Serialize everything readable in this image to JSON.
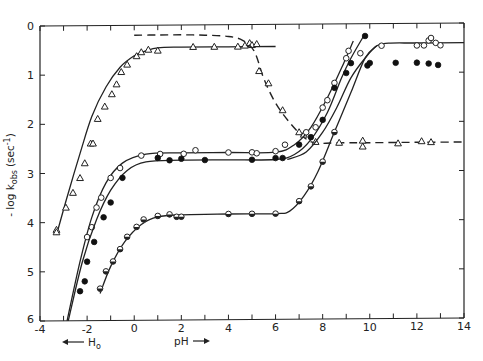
{
  "chart_data": {
    "type": "line",
    "title": "",
    "xlabel": "pH",
    "xlabel_left": "H0",
    "ylabel": "-log k_obs (sec^-1)",
    "xlim": [
      -4,
      14
    ],
    "ylim": [
      6,
      0
    ],
    "y_inverted": true,
    "grid": false,
    "x_ticks": [
      -4,
      -2,
      0,
      2,
      4,
      6,
      8,
      10,
      12,
      14
    ],
    "y_ticks": [
      0,
      1,
      2,
      3,
      4,
      5,
      6
    ],
    "series": [
      {
        "name": "triangles (solid)",
        "marker": "open-triangle",
        "line": "solid",
        "curve": [
          [
            -3.3,
            4.25
          ],
          [
            -2.8,
            3.4
          ],
          [
            -2.3,
            2.6
          ],
          [
            -1.8,
            1.85
          ],
          [
            -1.2,
            1.25
          ],
          [
            -0.6,
            0.85
          ],
          [
            0,
            0.62
          ],
          [
            0.5,
            0.52
          ],
          [
            1,
            0.46
          ],
          [
            2,
            0.45
          ],
          [
            4,
            0.45
          ],
          [
            6,
            0.45
          ]
        ],
        "points": [
          [
            -3.3,
            4.15
          ],
          [
            -3.3,
            4.2
          ],
          [
            -2.9,
            3.7
          ],
          [
            -2.6,
            3.4
          ],
          [
            -2.3,
            3.1
          ],
          [
            -2.1,
            2.8
          ],
          [
            -1.85,
            2.4
          ],
          [
            -1.75,
            2.4
          ],
          [
            -1.55,
            1.9
          ],
          [
            -1.25,
            1.65
          ],
          [
            -0.95,
            1.4
          ],
          [
            -0.75,
            1.2
          ],
          [
            -0.55,
            0.95
          ],
          [
            -0.3,
            0.8
          ],
          [
            0.1,
            0.63
          ],
          [
            0.3,
            0.55
          ],
          [
            0.6,
            0.5
          ],
          [
            1.0,
            0.52
          ],
          [
            2.5,
            0.45
          ],
          [
            3.4,
            0.45
          ],
          [
            4.4,
            0.45
          ],
          [
            4.7,
            0.43
          ],
          [
            4.9,
            0.38
          ],
          [
            5.0,
            0.42
          ],
          [
            5.2,
            0.4
          ]
        ]
      },
      {
        "name": "triangles (dashed)",
        "marker": "open-triangle",
        "line": "dashed",
        "curve": [
          [
            0,
            0.2
          ],
          [
            1,
            0.2
          ],
          [
            2,
            0.2
          ],
          [
            3,
            0.21
          ],
          [
            4,
            0.24
          ],
          [
            4.6,
            0.32
          ],
          [
            5.1,
            0.55
          ],
          [
            5.5,
            1.1
          ],
          [
            6,
            1.6
          ],
          [
            6.6,
            2.0
          ],
          [
            7.2,
            2.3
          ],
          [
            7.7,
            2.42
          ],
          [
            8.5,
            2.42
          ],
          [
            10,
            2.42
          ],
          [
            12,
            2.42
          ],
          [
            14,
            2.42
          ]
        ],
        "points": [
          [
            5.3,
            0.95
          ],
          [
            5.7,
            1.2
          ],
          [
            6.3,
            1.75
          ],
          [
            7.0,
            2.2
          ],
          [
            7.2,
            2.25
          ],
          [
            7.7,
            2.4
          ],
          [
            8.7,
            2.42
          ],
          [
            9.7,
            2.38
          ],
          [
            9.7,
            2.5
          ],
          [
            11.2,
            2.44
          ],
          [
            12.2,
            2.4
          ],
          [
            12.6,
            2.42
          ]
        ]
      },
      {
        "name": "open circles (upper)",
        "marker": "open-circle",
        "line": "solid",
        "curve": [
          [
            -2.85,
            6
          ],
          [
            -2.3,
            4.8
          ],
          [
            -1.8,
            3.9
          ],
          [
            -1.2,
            3.2
          ],
          [
            -0.5,
            2.8
          ],
          [
            0.5,
            2.62
          ],
          [
            2,
            2.6
          ],
          [
            4,
            2.6
          ],
          [
            6,
            2.6
          ],
          [
            6.8,
            2.45
          ],
          [
            7.5,
            2.1
          ],
          [
            8.2,
            1.5
          ],
          [
            8.8,
            0.9
          ],
          [
            9.3,
            0.35
          ]
        ],
        "points": [
          [
            -2.0,
            4.3
          ],
          [
            -1.8,
            4.1
          ],
          [
            -1.6,
            3.7
          ],
          [
            -1.4,
            3.5
          ],
          [
            -1.0,
            3.1
          ],
          [
            -0.6,
            2.9
          ],
          [
            0.3,
            2.65
          ],
          [
            1.1,
            2.62
          ],
          [
            2.1,
            2.62
          ],
          [
            2.6,
            2.55
          ],
          [
            4.0,
            2.6
          ],
          [
            5.0,
            2.6
          ],
          [
            5.2,
            2.62
          ],
          [
            6.0,
            2.58
          ],
          [
            6.4,
            2.45
          ],
          [
            7.3,
            2.2
          ],
          [
            7.7,
            2.1
          ],
          [
            8.0,
            1.7
          ],
          [
            8.2,
            1.55
          ],
          [
            8.5,
            1.2
          ],
          [
            9.0,
            0.7
          ],
          [
            9.1,
            0.55
          ]
        ]
      },
      {
        "name": "filled circles",
        "marker": "filled-circle",
        "line": "solid",
        "curve": [
          [
            -2.8,
            6
          ],
          [
            -2.2,
            4.8
          ],
          [
            -1.6,
            3.95
          ],
          [
            -1.0,
            3.35
          ],
          [
            -0.3,
            2.95
          ],
          [
            0.5,
            2.78
          ],
          [
            2,
            2.75
          ],
          [
            4,
            2.75
          ],
          [
            6,
            2.75
          ],
          [
            6.8,
            2.65
          ],
          [
            7.5,
            2.35
          ],
          [
            8.2,
            1.8
          ],
          [
            8.8,
            1.1
          ],
          [
            9.2,
            0.7
          ],
          [
            9.8,
            0.2
          ]
        ],
        "points": [
          [
            -2.3,
            5.4
          ],
          [
            -2.1,
            5.2
          ],
          [
            -2.0,
            4.8
          ],
          [
            -1.7,
            4.4
          ],
          [
            -1.3,
            3.9
          ],
          [
            -1.0,
            3.6
          ],
          [
            -0.5,
            3.1
          ],
          [
            1.0,
            2.7
          ],
          [
            1.5,
            2.75
          ],
          [
            2.0,
            2.72
          ],
          [
            3.0,
            2.75
          ],
          [
            5.0,
            2.75
          ],
          [
            6.0,
            2.72
          ],
          [
            6.3,
            2.72
          ],
          [
            7.0,
            2.45
          ],
          [
            7.5,
            2.3
          ],
          [
            8.0,
            1.95
          ],
          [
            8.5,
            1.3
          ],
          [
            9.0,
            1.0
          ],
          [
            9.2,
            0.8
          ],
          [
            9.8,
            0.25
          ],
          [
            9.9,
            0.85
          ],
          [
            10.0,
            0.8
          ],
          [
            11.1,
            0.8
          ],
          [
            12.0,
            0.8
          ],
          [
            12.5,
            0.82
          ],
          [
            12.9,
            0.85
          ]
        ]
      },
      {
        "name": "open circles (plateau 0.4)",
        "marker": "open-circle",
        "line": "solid",
        "curve": [
          [
            6.5,
            2.75
          ],
          [
            7.3,
            2.6
          ],
          [
            8.0,
            2.2
          ],
          [
            8.6,
            1.7
          ],
          [
            9.2,
            1.1
          ],
          [
            9.8,
            0.7
          ],
          [
            10.3,
            0.45
          ],
          [
            10.8,
            0.4
          ],
          [
            12,
            0.4
          ],
          [
            14,
            0.4
          ]
        ],
        "points": [
          [
            9.6,
            0.6
          ],
          [
            10.5,
            0.45
          ],
          [
            12.0,
            0.45
          ],
          [
            12.3,
            0.45
          ],
          [
            12.5,
            0.35
          ],
          [
            12.6,
            0.3
          ],
          [
            12.8,
            0.4
          ],
          [
            13.0,
            0.45
          ]
        ]
      },
      {
        "name": "half-filled circles (lower)",
        "marker": "half-circle",
        "line": "solid",
        "curve": [
          [
            -1.45,
            5.45
          ],
          [
            -1.0,
            4.9
          ],
          [
            -0.4,
            4.4
          ],
          [
            0.3,
            4.05
          ],
          [
            1.0,
            3.9
          ],
          [
            2,
            3.86
          ],
          [
            4,
            3.85
          ],
          [
            6,
            3.85
          ],
          [
            6.6,
            3.8
          ],
          [
            7.2,
            3.5
          ],
          [
            7.8,
            3.0
          ],
          [
            8.5,
            2.2
          ],
          [
            9.2,
            1.4
          ],
          [
            9.8,
            0.7
          ],
          [
            10.3,
            0.45
          ]
        ],
        "points": [
          [
            -1.45,
            5.35
          ],
          [
            -1.2,
            5.0
          ],
          [
            -0.9,
            4.8
          ],
          [
            -0.6,
            4.55
          ],
          [
            -0.3,
            4.3
          ],
          [
            0.1,
            4.1
          ],
          [
            0.4,
            3.95
          ],
          [
            1.0,
            3.88
          ],
          [
            1.5,
            3.85
          ],
          [
            1.8,
            3.9
          ],
          [
            2.0,
            3.9
          ],
          [
            4.0,
            3.85
          ],
          [
            5.0,
            3.85
          ],
          [
            6.0,
            3.85
          ],
          [
            7.0,
            3.6
          ],
          [
            7.5,
            3.3
          ],
          [
            8.0,
            2.8
          ],
          [
            8.5,
            2.2
          ]
        ]
      }
    ]
  },
  "axes": {
    "y_title": "- log k",
    "y_title_sub": "obs",
    "y_title_unit": "(sec",
    "y_title_exp": "-1",
    "y_title_close": ")",
    "x_title_ph": "pH",
    "x_title_h0": "H",
    "x_title_h0_sub": "o",
    "x_tick_labels": [
      "-4",
      "-2",
      "0",
      "2",
      "4",
      "6",
      "8",
      "10",
      "12",
      "14"
    ],
    "y_tick_labels": [
      "0",
      "1",
      "2",
      "3",
      "4",
      "5",
      "6"
    ]
  }
}
